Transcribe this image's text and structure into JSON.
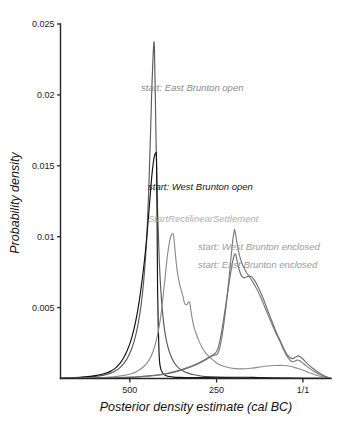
{
  "chart_data": {
    "type": "line",
    "title": "",
    "subtitle": "",
    "xlabel": "Posterior density estimate (cal BC)",
    "ylabel": "Probability density",
    "xlim": [
      700,
      -80
    ],
    "ylim": [
      0,
      0.025
    ],
    "x_tick_labels": [
      "500",
      "250",
      "1/1"
    ],
    "x_tick_values": [
      500,
      250,
      1
    ],
    "y_tick_labels": [
      "0.005",
      "0.01",
      "0.015",
      "0.02",
      "0.025"
    ],
    "y_tick_values": [
      0.005,
      0.01,
      0.015,
      0.02,
      0.025
    ],
    "grid": false,
    "legend_position": "inline-annotations",
    "axis_direction": "x decreasing (cal BC)",
    "series": [
      {
        "name": "start: East Brunton open",
        "color": "#5a5a5a",
        "peak_x": 430,
        "peak_y": 0.0237,
        "points_x": [
          700,
          660,
          630,
          600,
          575,
          555,
          540,
          528,
          518,
          508,
          498,
          488,
          478,
          468,
          460,
          452,
          446,
          441,
          437,
          433,
          431,
          430,
          429,
          427,
          424,
          420,
          415,
          409,
          402,
          394,
          385,
          374,
          362,
          348,
          332,
          315,
          295,
          270,
          240,
          200,
          150,
          90,
          20,
          -40,
          -80
        ],
        "points_y": [
          2e-05,
          4e-05,
          8e-05,
          0.00014,
          0.00024,
          0.00038,
          0.00056,
          0.00078,
          0.00105,
          0.0014,
          0.0019,
          0.0026,
          0.0036,
          0.0051,
          0.0069,
          0.0096,
          0.0131,
          0.0168,
          0.0202,
          0.0228,
          0.0236,
          0.0237,
          0.0231,
          0.0205,
          0.0162,
          0.0118,
          0.0082,
          0.0056,
          0.0038,
          0.0026,
          0.0018,
          0.0012,
          0.0008,
          0.00055,
          0.00038,
          0.00026,
          0.00018,
          0.00012,
          8e-05,
          5e-05,
          3e-05,
          2e-05,
          1e-05,
          1e-05,
          0.0
        ]
      },
      {
        "name": "start: West Brunton open",
        "color": "#111111",
        "peak_x": 424,
        "peak_y": 0.0159,
        "points_x": [
          700,
          660,
          630,
          600,
          575,
          555,
          540,
          528,
          518,
          508,
          498,
          488,
          478,
          468,
          458,
          450,
          443,
          437,
          432,
          428,
          425,
          424,
          423,
          422,
          421,
          420,
          418,
          416,
          414,
          411,
          407,
          402,
          395,
          386,
          374,
          358,
          338,
          312,
          280,
          240,
          195,
          145,
          95,
          40,
          -20,
          -80
        ],
        "points_y": [
          3e-05,
          6e-05,
          0.00011,
          0.0002,
          0.00033,
          0.00052,
          0.00077,
          0.00108,
          0.00146,
          0.00196,
          0.0026,
          0.0035,
          0.0047,
          0.0063,
          0.0083,
          0.0103,
          0.0124,
          0.0142,
          0.0153,
          0.0158,
          0.0159,
          0.0159,
          0.0152,
          0.0128,
          0.0094,
          0.0062,
          0.0036,
          0.0019,
          0.0011,
          0.0007,
          0.00046,
          0.0003,
          0.0002,
          0.00014,
          0.0001,
          8e-05,
          7e-05,
          7e-05,
          8e-05,
          9e-05,
          9e-05,
          8e-05,
          5e-05,
          3e-05,
          1e-05,
          0.0
        ]
      },
      {
        "name": "StartRectilinearSettlement",
        "color": "#8c8c8c",
        "peak_x": 375,
        "peak_y": 0.0102,
        "points_x": [
          700,
          650,
          610,
          575,
          545,
          520,
          498,
          480,
          464,
          450,
          438,
          428,
          420,
          412,
          405,
          398,
          392,
          386,
          381,
          377,
          375,
          373,
          370,
          366,
          361,
          355,
          348,
          342,
          336,
          331,
          327,
          324,
          320,
          315,
          308,
          300,
          290,
          278,
          265,
          250,
          234,
          216,
          196,
          175,
          152,
          128,
          104,
          80,
          58,
          38,
          20,
          2,
          -14,
          -30,
          -46,
          -62,
          -80
        ],
        "points_y": [
          1e-05,
          2e-05,
          4e-05,
          7e-05,
          0.00012,
          0.0002,
          0.00032,
          0.0005,
          0.00076,
          0.0011,
          0.0016,
          0.0023,
          0.0031,
          0.0042,
          0.0056,
          0.0072,
          0.0086,
          0.0096,
          0.0101,
          0.0102,
          0.0102,
          0.0099,
          0.0091,
          0.0081,
          0.0072,
          0.0065,
          0.0059,
          0.0053,
          0.0052,
          0.0054,
          0.0053,
          0.0048,
          0.0042,
          0.0036,
          0.0031,
          0.0026,
          0.0021,
          0.0017,
          0.0014,
          0.0011,
          0.0009,
          0.00078,
          0.0007,
          0.00068,
          0.00072,
          0.0008,
          0.00088,
          0.00092,
          0.00092,
          0.00086,
          0.00074,
          0.0006,
          0.00044,
          0.0003,
          0.00018,
          8e-05,
          0.0
        ]
      },
      {
        "name": "start: West Brunton enclosed",
        "color": "#7a7a7a",
        "peak_x": 198,
        "peak_y": 0.0105,
        "points_x": [
          700,
          640,
          590,
          545,
          505,
          470,
          440,
          412,
          388,
          366,
          346,
          328,
          312,
          298,
          286,
          276,
          268,
          262,
          257,
          253,
          250,
          246,
          242,
          237,
          231,
          224,
          216,
          208,
          203,
          199,
          198,
          196,
          192,
          186,
          178,
          169,
          159,
          148,
          136,
          124,
          112,
          100,
          88,
          77,
          67,
          58,
          50,
          42,
          34,
          26,
          18,
          10,
          2,
          -8,
          -20,
          -34,
          -50,
          -66,
          -80
        ],
        "points_y": [
          1e-05,
          2e-05,
          3e-05,
          5e-05,
          8e-05,
          0.00012,
          0.00018,
          0.00026,
          0.00036,
          0.00048,
          0.00062,
          0.00078,
          0.00094,
          0.0011,
          0.00125,
          0.0014,
          0.00152,
          0.0016,
          0.00164,
          0.00166,
          0.00168,
          0.00178,
          0.00205,
          0.0026,
          0.0035,
          0.0048,
          0.0066,
          0.0086,
          0.0098,
          0.0104,
          0.0105,
          0.0103,
          0.0097,
          0.0089,
          0.0082,
          0.0077,
          0.0073,
          0.0069,
          0.0064,
          0.0058,
          0.0051,
          0.0044,
          0.0037,
          0.0031,
          0.0026,
          0.0021,
          0.0017,
          0.0014,
          0.0012,
          0.0012,
          0.0013,
          0.00125,
          0.0011,
          0.0009,
          0.00068,
          0.00046,
          0.00026,
          0.0001,
          0.0
        ]
      },
      {
        "name": "start: East Brunton enclosed",
        "color": "#6f6f6f",
        "peak_x": 196,
        "peak_y": 0.0088,
        "points_x": [
          700,
          640,
          590,
          545,
          505,
          470,
          440,
          412,
          388,
          366,
          346,
          328,
          312,
          298,
          286,
          276,
          268,
          261,
          255,
          250,
          245,
          240,
          234,
          227,
          219,
          211,
          204,
          199,
          196,
          194,
          190,
          184,
          177,
          169,
          160,
          150,
          140,
          129,
          118,
          107,
          96,
          85,
          75,
          65,
          56,
          47,
          39,
          31,
          23,
          15,
          7,
          -2,
          -14,
          -28,
          -44,
          -60,
          -80
        ],
        "points_y": [
          1e-05,
          2e-05,
          3e-05,
          5e-05,
          8e-05,
          0.00013,
          0.0002,
          0.00028,
          0.00039,
          0.00052,
          0.00066,
          0.00082,
          0.00098,
          0.00114,
          0.0013,
          0.00144,
          0.00156,
          0.00166,
          0.00176,
          0.0019,
          0.0022,
          0.0027,
          0.0035,
          0.0046,
          0.0059,
          0.0072,
          0.0082,
          0.0087,
          0.0088,
          0.0087,
          0.0082,
          0.0076,
          0.0072,
          0.0071,
          0.0072,
          0.0072,
          0.0069,
          0.0064,
          0.0058,
          0.0051,
          0.0044,
          0.0037,
          0.0031,
          0.0026,
          0.0021,
          0.0017,
          0.0015,
          0.0014,
          0.0015,
          0.0016,
          0.0015,
          0.0013,
          0.001,
          0.0007,
          0.00042,
          0.0002,
          0.0
        ]
      }
    ],
    "annotations": [
      {
        "text": "start: East Brunton open",
        "x_px": 141,
        "y_px": 91,
        "color": "#8a8a8a"
      },
      {
        "text": "start: West Brunton open",
        "x_px": 148,
        "y_px": 190,
        "color": "#161616"
      },
      {
        "text": "StartRectilinearSettlement",
        "x_px": 148,
        "y_px": 222,
        "color": "#b0b0b0"
      },
      {
        "text": "start: West Brunton enclosed",
        "x_px": 198,
        "y_px": 250,
        "color": "#9a9a9a"
      },
      {
        "text": "start: East Brunton enclosed",
        "x_px": 198,
        "y_px": 268,
        "color": "#9a9a9a"
      }
    ]
  },
  "axes": {
    "x_title": "Posterior density estimate (cal BC)",
    "y_title": "Probability density"
  }
}
